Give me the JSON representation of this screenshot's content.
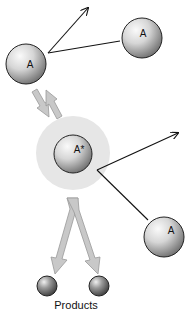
{
  "diagram": {
    "type": "molecular-activation-schematic",
    "nodes": [
      {
        "id": "a-left",
        "label": "A"
      },
      {
        "id": "a-top-right",
        "label": "A"
      },
      {
        "id": "a-star",
        "label": "A*"
      },
      {
        "id": "a-bottom-right",
        "label": "A"
      },
      {
        "id": "product-1",
        "label": ""
      },
      {
        "id": "product-2",
        "label": ""
      }
    ],
    "products_label": "Products",
    "colors": {
      "sphere_light": "#f4f4f4",
      "sphere_dark": "#7a7a7a",
      "glow": "#e6e6e6",
      "arrow_fill": "#c8c8c8",
      "arrow_stroke": "#9a9a9a",
      "line": "#111111"
    }
  }
}
